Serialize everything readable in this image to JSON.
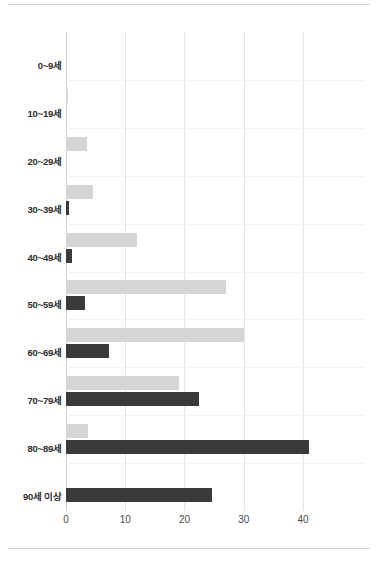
{
  "chart_data": {
    "type": "bar",
    "orientation": "horizontal",
    "title": "",
    "subtitle": "",
    "xlabel": "",
    "ylabel": "",
    "categories": [
      "0~9세",
      "10~19세",
      "20~29세",
      "30~39세",
      "40~49세",
      "50~59세",
      "60~69세",
      "70~79세",
      "80~89세",
      "90세 이상"
    ],
    "series": [
      {
        "name": "series-light",
        "color": "#d5d5d5",
        "values": [
          0,
          0.3,
          3.5,
          4.6,
          12,
          27,
          30,
          19,
          3.7,
          0
        ]
      },
      {
        "name": "series-dark",
        "color": "#3a3a3a",
        "values": [
          0,
          0,
          0,
          0.5,
          1.0,
          3.2,
          7.3,
          22.5,
          41,
          24.7
        ]
      }
    ],
    "x_ticks": [
      0,
      10,
      20,
      30,
      40
    ],
    "x_tick_labels": [
      "0",
      "10",
      "20",
      "30",
      "40"
    ],
    "xlim": [
      0,
      50.3
    ],
    "grid": true,
    "grid_axis": "x",
    "legend": "none"
  },
  "colors": {
    "background": "#ffffff",
    "gridline": "#e4e4e4",
    "axis": "#d0d0d0",
    "rule": "#d4d4d4",
    "label_text": "#2e2e2e",
    "tick_text": "#4a4a4a"
  }
}
